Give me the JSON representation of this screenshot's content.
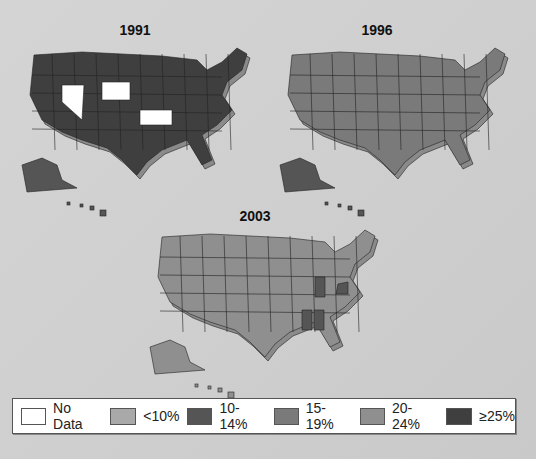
{
  "chart_data": {
    "type": "choropleth",
    "title": "",
    "maps": [
      {
        "title": "1991"
      },
      {
        "title": "1996"
      },
      {
        "title": "2003"
      }
    ],
    "legend": [
      {
        "label": "No Data",
        "color": "#ffffff"
      },
      {
        "label": "<10%",
        "color": "#a9a9a9"
      },
      {
        "label": "10-14%",
        "color": "#555555"
      },
      {
        "label": "15-19%",
        "color": "#7a7a7a"
      },
      {
        "label": "20-24%",
        "color": "#8f8f8f"
      },
      {
        "label": "≥25%",
        "color": "#3f3f3f"
      }
    ]
  }
}
